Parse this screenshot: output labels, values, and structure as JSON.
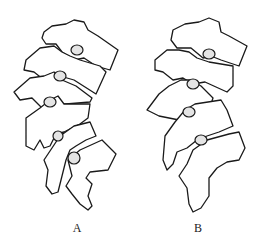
{
  "figures": [
    {
      "label": "A",
      "description": "lumbar vertebrae lateral outline, variant A"
    },
    {
      "label": "B",
      "description": "lumbar vertebrae lateral outline, variant B"
    }
  ],
  "colors": {
    "stroke": "#1a1a1a",
    "joint_fill": "#e4e4e4",
    "background": "#ffffff"
  }
}
